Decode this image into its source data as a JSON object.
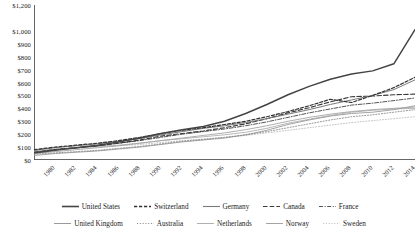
{
  "chart_data": {
    "type": "line",
    "title": "",
    "xlabel": "",
    "ylabel": "",
    "ylim": [
      0,
      1200
    ],
    "xlim": [
      1980,
      2016
    ],
    "grid": false,
    "legend_position": "bottom",
    "y_ticks": [
      "$0",
      "$100",
      "$200",
      "$300",
      "$400",
      "$500",
      "$600",
      "$700",
      "$800",
      "$900",
      "$1,000",
      "$1,200"
    ],
    "y_tick_values": [
      0,
      100,
      200,
      300,
      400,
      500,
      600,
      700,
      800,
      900,
      1000,
      1200
    ],
    "x": [
      1980,
      1982,
      1984,
      1986,
      1988,
      1990,
      1992,
      1994,
      1996,
      1998,
      2000,
      2002,
      2004,
      2006,
      2008,
      2010,
      2012,
      2014,
      2016
    ],
    "categories": [
      "1980",
      "1982",
      "1984",
      "1986",
      "1988",
      "1990",
      "1992",
      "1994",
      "1996",
      "1998",
      "2000",
      "2002",
      "2004",
      "2006",
      "2008",
      "2010",
      "2012",
      "2014",
      "2016"
    ],
    "series": [
      {
        "name": "United States",
        "color": "#444444",
        "style": "solid",
        "width": 1.5,
        "values": [
          55,
          75,
          95,
          115,
          140,
          170,
          205,
          235,
          260,
          300,
          360,
          430,
          505,
          570,
          625,
          665,
          690,
          745,
          1010
        ]
      },
      {
        "name": "Switzerland",
        "color": "#333333",
        "style": "dashed",
        "width": 1.2,
        "values": [
          80,
          100,
          115,
          130,
          150,
          175,
          205,
          230,
          250,
          275,
          300,
          335,
          375,
          420,
          470,
          445,
          500,
          560,
          640
        ]
      },
      {
        "name": "Germany",
        "color": "#7a7a7a",
        "style": "solid",
        "width": 1.0,
        "values": [
          75,
          95,
          110,
          125,
          145,
          165,
          195,
          220,
          245,
          265,
          290,
          320,
          355,
          390,
          430,
          465,
          500,
          545,
          620
        ]
      },
      {
        "name": "Canada",
        "color": "#3a3a3a",
        "style": "dash-dash",
        "width": 1.1,
        "values": [
          60,
          80,
          95,
          110,
          130,
          155,
          185,
          205,
          225,
          250,
          280,
          320,
          365,
          405,
          450,
          490,
          495,
          505,
          510
        ]
      },
      {
        "name": "France",
        "color": "#555555",
        "style": "dash-dot",
        "width": 1.0,
        "values": [
          60,
          80,
          95,
          110,
          130,
          150,
          175,
          200,
          220,
          240,
          265,
          295,
          330,
          365,
          395,
          425,
          440,
          460,
          480
        ]
      },
      {
        "name": "United Kingdom",
        "color": "#9a9a9a",
        "style": "solid",
        "width": 0.9,
        "values": [
          35,
          50,
          60,
          70,
          85,
          100,
          120,
          140,
          155,
          170,
          195,
          230,
          275,
          310,
          340,
          360,
          370,
          390,
          420
        ]
      },
      {
        "name": "Australia",
        "color": "#8a8a8a",
        "style": "dotted",
        "width": 0.9,
        "values": [
          45,
          55,
          65,
          75,
          90,
          105,
          125,
          145,
          160,
          175,
          195,
          220,
          250,
          280,
          310,
          335,
          350,
          370,
          390
        ]
      },
      {
        "name": "Netherlands",
        "color": "#b0b0b0",
        "style": "solid",
        "width": 0.9,
        "values": [
          70,
          85,
          95,
          105,
          115,
          130,
          150,
          165,
          180,
          195,
          215,
          245,
          285,
          315,
          345,
          370,
          385,
          395,
          400
        ]
      },
      {
        "name": "Norway",
        "color": "#a5a5a5",
        "style": "solid",
        "width": 0.9,
        "values": [
          50,
          65,
          80,
          95,
          110,
          130,
          150,
          170,
          190,
          210,
          235,
          265,
          300,
          330,
          355,
          375,
          390,
          400,
          410
        ]
      },
      {
        "name": "Sweden",
        "color": "#c0c0c0",
        "style": "dotted",
        "width": 0.9,
        "values": [
          65,
          80,
          90,
          100,
          110,
          120,
          135,
          150,
          160,
          175,
          190,
          210,
          230,
          250,
          270,
          290,
          305,
          320,
          335
        ]
      }
    ]
  },
  "legend": {
    "rows": [
      [
        {
          "label": "United States",
          "style": "solid",
          "color": "#444444",
          "width": 1.6
        },
        {
          "label": "Switzerland",
          "style": "dashed",
          "color": "#333333",
          "width": 1.3
        },
        {
          "label": "Germany",
          "style": "solid",
          "color": "#7a7a7a",
          "width": 1.1
        },
        {
          "label": "Canada",
          "style": "dash-dash",
          "color": "#3a3a3a",
          "width": 1.2
        },
        {
          "label": "France",
          "style": "dash-dot",
          "color": "#555555",
          "width": 1.1
        }
      ],
      [
        {
          "label": "United Kingdom",
          "style": "solid",
          "color": "#9a9a9a",
          "width": 1.0
        },
        {
          "label": "Australia",
          "style": "dotted",
          "color": "#8a8a8a",
          "width": 1.0
        },
        {
          "label": "Netherlands",
          "style": "solid",
          "color": "#b0b0b0",
          "width": 1.0
        },
        {
          "label": "Norway",
          "style": "solid",
          "color": "#a5a5a5",
          "width": 1.0
        },
        {
          "label": "Sweden",
          "style": "dotted",
          "color": "#c0c0c0",
          "width": 1.0
        }
      ]
    ]
  },
  "axis": {
    "color": "#555555"
  }
}
